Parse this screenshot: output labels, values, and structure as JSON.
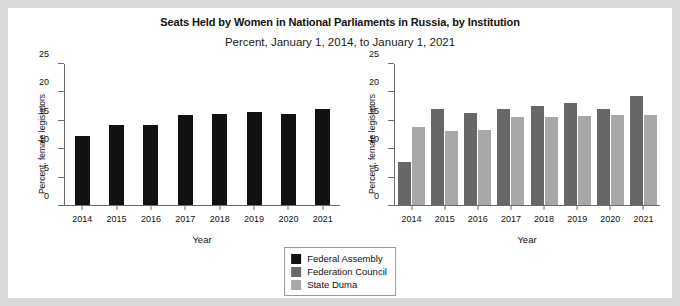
{
  "chart_data": {
    "type": "bar",
    "title": "Seats Held by Women in National Parliaments in Russia, by Institution",
    "subtitle": "Percent, January 1, 2014, to January 1, 2021",
    "xlabel": "Year",
    "ylabel": "Percent, female legislators",
    "categories": [
      "2014",
      "2015",
      "2016",
      "2017",
      "2018",
      "2019",
      "2020",
      "2021"
    ],
    "ylim": [
      0,
      25
    ],
    "yticks": [
      0,
      5,
      10,
      15,
      20,
      25
    ],
    "ytick_labels": [
      "0",
      "5",
      "10",
      "15",
      "20",
      "25"
    ],
    "grid": false,
    "legend_position": "bottom-center",
    "panels": [
      {
        "name": "left-panel",
        "series": [
          {
            "name": "Federal Assembly",
            "color": "#111111",
            "values": [
              12.2,
              14.2,
              14.2,
              16.0,
              16.2,
              16.5,
              16.2,
              17.0
            ]
          }
        ]
      },
      {
        "name": "right-panel",
        "series": [
          {
            "name": "Federation Council",
            "color": "#676767",
            "values": [
              7.7,
              17.0,
              16.3,
              17.0,
              17.6,
              18.1,
              17.0,
              19.3
            ]
          },
          {
            "name": "State Duma",
            "color": "#a8a8a8",
            "values": [
              13.9,
              13.1,
              13.3,
              15.6,
              15.6,
              15.8,
              16.0,
              16.0
            ]
          }
        ]
      }
    ],
    "legend": [
      {
        "label": "Federal Assembly",
        "color": "#111111"
      },
      {
        "label": "Federation Council",
        "color": "#676767"
      },
      {
        "label": "State Duma",
        "color": "#a8a8a8"
      }
    ]
  }
}
